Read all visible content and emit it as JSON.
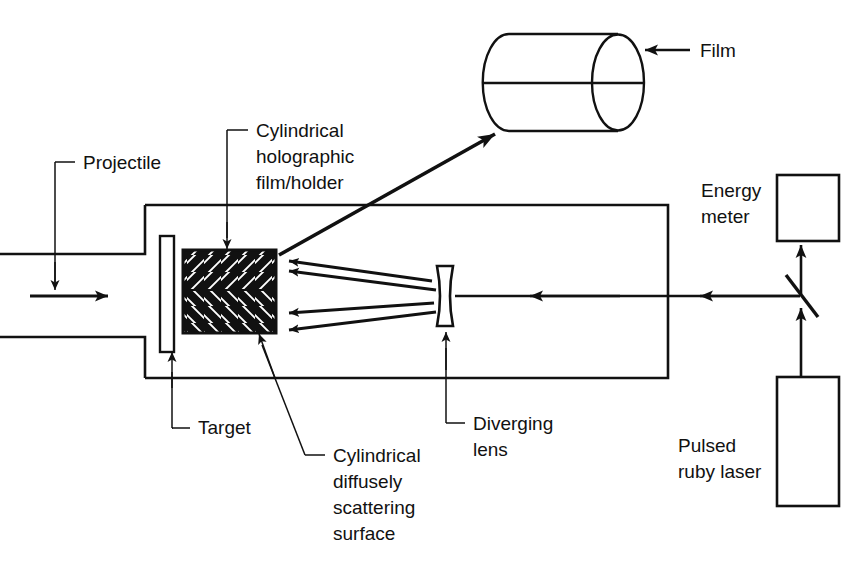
{
  "figure": {
    "background_color": "#ffffff",
    "line_color": "#111111",
    "canvas": {
      "width": 868,
      "height": 565
    }
  },
  "labels": {
    "projectile": "Projectile",
    "cylindrical_holographic_film_holder_line1": "Cylindrical",
    "cylindrical_holographic_film_holder_line2": "holographic",
    "cylindrical_holographic_film_holder_line3": "film/holder",
    "film": "Film",
    "energy_meter_line1": "Energy",
    "energy_meter_line2": "meter",
    "target": "Target",
    "cylindrical_scattering_line1": "Cylindrical",
    "cylindrical_scattering_line2": "diffusely",
    "cylindrical_scattering_line3": "scattering",
    "cylindrical_scattering_line4": "surface",
    "diverging_lens_line1": "Diverging",
    "diverging_lens_line2": "lens",
    "pulsed_ruby_laser_line1": "Pulsed",
    "pulsed_ruby_laser_line2": "ruby laser"
  },
  "components": {
    "barrel": "gun-barrel",
    "impact_chamber": "impact-chamber",
    "target_plate": "target-plate",
    "hatched_holder": "cylindrical-holographic-film-holder",
    "diverging_lens": "diverging-lens",
    "beam_splitter": "beam-splitter",
    "energy_meter_box": "energy-meter",
    "laser_box": "pulsed-ruby-laser",
    "film_cylinder": "film-cylinder"
  },
  "beam_paths": {
    "scattered_beam_count": 4,
    "scattered_beam_direction": "leftward",
    "laser_beam_direction": "leftward-from-laser-through-splitter-to-lens",
    "energy_meter_beam_direction": "upward",
    "projectile_direction": "rightward"
  }
}
